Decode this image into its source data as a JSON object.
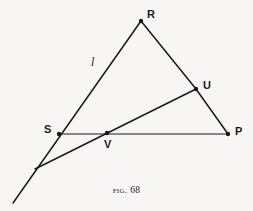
{
  "figure": {
    "caption_prefix": "Fig.",
    "caption_number": "68",
    "background_color": "#f7f6f4",
    "ink_color": "#1c1a18"
  },
  "points": [
    {
      "id": "R",
      "label": "R",
      "x": 141,
      "y": 21,
      "label_x": 147,
      "label_y": 9,
      "marker": true
    },
    {
      "id": "U",
      "label": "U",
      "x": 196,
      "y": 89,
      "label_x": 203,
      "label_y": 80,
      "marker": true
    },
    {
      "id": "P",
      "label": "P",
      "x": 228,
      "y": 134,
      "label_x": 235,
      "label_y": 126,
      "marker": true
    },
    {
      "id": "S",
      "label": "S",
      "x": 59,
      "y": 134,
      "label_x": 44,
      "label_y": 124,
      "marker": true
    },
    {
      "id": "V",
      "label": "V",
      "x": 107,
      "y": 133,
      "label_x": 104,
      "label_y": 139,
      "marker": true
    },
    {
      "id": "X",
      "label": "",
      "x": 35,
      "y": 169,
      "label_x": 0,
      "label_y": 0,
      "marker": false
    },
    {
      "id": "T",
      "label": "",
      "x": 13,
      "y": 203,
      "label_x": 0,
      "label_y": 0,
      "marker": false
    }
  ],
  "line_labels": [
    {
      "id": "l",
      "label": "l",
      "label_x": 91,
      "label_y": 56
    }
  ],
  "segments": [
    {
      "id": "seg-R-T",
      "from": "R",
      "to": "T",
      "width": 1.5,
      "note": "side RS extended through S to crossing and tail"
    },
    {
      "id": "seg-R-U",
      "from": "R",
      "to": "U",
      "width": 1.5,
      "note": "side RP upper part"
    },
    {
      "id": "seg-U-P",
      "from": "U",
      "to": "P",
      "width": 1.5,
      "note": "side RP lower part"
    },
    {
      "id": "seg-S-P",
      "from": "S",
      "to": "P",
      "width": 1.2,
      "note": "base line S to P through V"
    },
    {
      "id": "seg-X-U",
      "from": "X",
      "to": "U",
      "width": 1.5,
      "note": "transversal from crossing through V to U"
    }
  ]
}
